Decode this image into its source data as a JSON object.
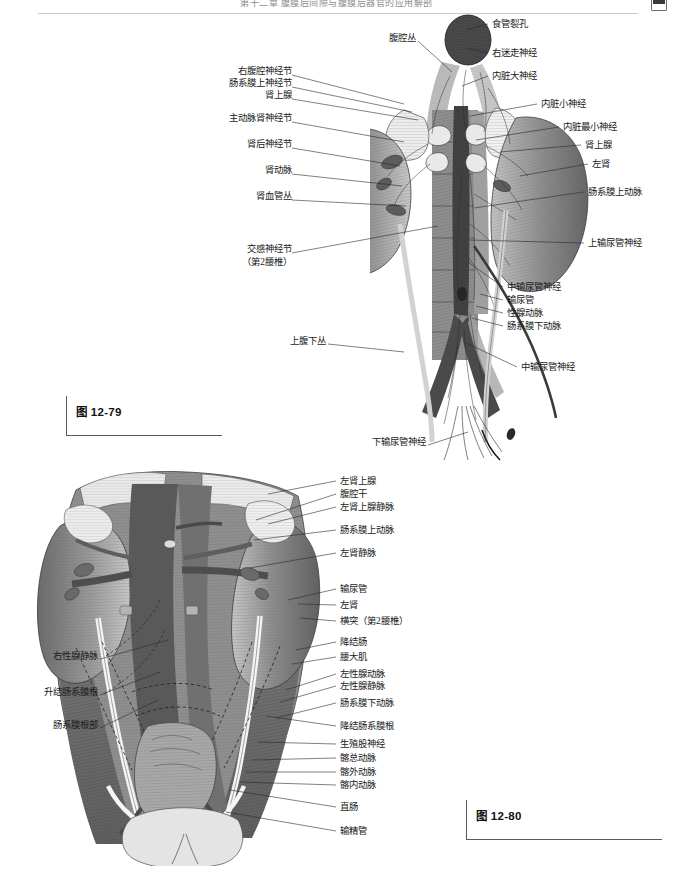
{
  "page": {
    "running_head": "第十二章  腹膜后间隙与腹膜后器官的应用解剖",
    "width": 673,
    "height": 878
  },
  "figures": [
    {
      "id": "fig-12-79",
      "caption": "图 12-79",
      "subject": "腹膜后腰部自主神经丛与肾、肾上腺",
      "labels_left": [
        {
          "text": "右腹腔神经节",
          "x": 228,
          "y": 71
        },
        {
          "text": "肠系膜上神经节",
          "x": 215,
          "y": 83
        },
        {
          "text": "肾上腺",
          "x": 259,
          "y": 95
        },
        {
          "text": "主动脉肾神经节",
          "x": 217,
          "y": 118
        },
        {
          "text": "肾后神经节",
          "x": 238,
          "y": 144
        },
        {
          "text": "肾动脉",
          "x": 242,
          "y": 170
        },
        {
          "text": "肾血管丛",
          "x": 232,
          "y": 196
        },
        {
          "text": "交感神经节",
          "x": 226,
          "y": 249
        },
        {
          "text": "（第2腰椎）",
          "x": 224,
          "y": 262
        },
        {
          "text": "上腹下丛",
          "x": 287,
          "y": 340
        },
        {
          "text": "下输尿管神经",
          "x": 369,
          "y": 441
        }
      ],
      "labels_top": [
        {
          "text": "腹腔丛",
          "x": 383,
          "y": 37
        }
      ],
      "labels_right": [
        {
          "text": "食管裂孔",
          "x": 492,
          "y": 20
        },
        {
          "text": "右迷走神经",
          "x": 492,
          "y": 49
        },
        {
          "text": "内脏大神经",
          "x": 492,
          "y": 72
        },
        {
          "text": "内脏小神经",
          "x": 541,
          "y": 100
        },
        {
          "text": "内脏最小神经",
          "x": 563,
          "y": 123
        },
        {
          "text": "肾上腺",
          "x": 585,
          "y": 141
        },
        {
          "text": "左肾",
          "x": 592,
          "y": 160
        },
        {
          "text": "肠系膜上动脉",
          "x": 588,
          "y": 188
        },
        {
          "text": "上输尿管神经",
          "x": 588,
          "y": 239
        },
        {
          "text": "中输尿管神经",
          "x": 507,
          "y": 283
        },
        {
          "text": "输尿管",
          "x": 507,
          "y": 296
        },
        {
          "text": "性腺动脉",
          "x": 507,
          "y": 309
        },
        {
          "text": "肠系膜下动脉",
          "x": 507,
          "y": 322
        },
        {
          "text": "中输尿管神经",
          "x": 521,
          "y": 363
        }
      ]
    },
    {
      "id": "fig-12-80",
      "caption": "图 12-80",
      "subject": "腹膜后间隙的血管、脏器与腹膜附着",
      "labels_left": [
        {
          "text": "右性腺静脉",
          "x": 22,
          "y": 655
        },
        {
          "text": "升结肠系膜根",
          "x": 13,
          "y": 691
        },
        {
          "text": "肠系膜根部",
          "x": 27,
          "y": 724
        }
      ],
      "labels_right": [
        {
          "text": "左肾上腺",
          "x": 340,
          "y": 477
        },
        {
          "text": "腹腔干",
          "x": 340,
          "y": 490
        },
        {
          "text": "左肾上腺静脉",
          "x": 340,
          "y": 503
        },
        {
          "text": "肠系膜上动脉",
          "x": 340,
          "y": 526
        },
        {
          "text": "左肾静脉",
          "x": 340,
          "y": 549
        },
        {
          "text": "输尿管",
          "x": 340,
          "y": 585
        },
        {
          "text": "左肾",
          "x": 340,
          "y": 601
        },
        {
          "text": "横突（第2腰椎）",
          "x": 340,
          "y": 617
        },
        {
          "text": "降结肠",
          "x": 340,
          "y": 638
        },
        {
          "text": "腰大肌",
          "x": 340,
          "y": 653
        },
        {
          "text": "左性腺动脉",
          "x": 340,
          "y": 670
        },
        {
          "text": "左性腺静脉",
          "x": 340,
          "y": 682
        },
        {
          "text": "肠系膜下动脉",
          "x": 340,
          "y": 699
        },
        {
          "text": "降结肠系膜根",
          "x": 340,
          "y": 722
        },
        {
          "text": "生殖股神经",
          "x": 340,
          "y": 740
        },
        {
          "text": "髂总动脉",
          "x": 340,
          "y": 754
        },
        {
          "text": "髂外动脉",
          "x": 340,
          "y": 768
        },
        {
          "text": "髂内动脉",
          "x": 340,
          "y": 781
        },
        {
          "text": "直肠",
          "x": 340,
          "y": 803
        },
        {
          "text": "输精管",
          "x": 340,
          "y": 827
        }
      ]
    }
  ],
  "colors": {
    "ink": "#1b1b1b",
    "leader": "#2a2a2a",
    "rule": "#c8c8c8",
    "caption_bar": "#5a5a5a",
    "tissue_dark": "#555555",
    "tissue_mid": "#8a8a8a",
    "tissue_light": "#cfcfcf",
    "tissue_pale": "#e8e8e8"
  }
}
